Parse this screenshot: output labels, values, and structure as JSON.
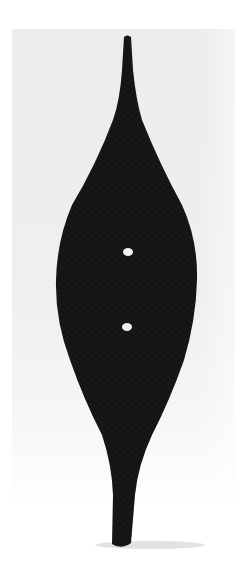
{
  "image": {
    "alt": "Dark carved wooden object with tapered ends and two small holes, photographed on a light gray background",
    "colors": {
      "background": "#ffffff",
      "backdrop": "#ececec",
      "object": "#161412",
      "object_texture": "#2a2725",
      "holes": "#f2f2f2",
      "shadow": "#dcdcdc"
    },
    "features": {
      "holes": [
        {
          "cx": 128,
          "cy": 252
        },
        {
          "cx": 127,
          "cy": 327
        }
      ]
    }
  }
}
